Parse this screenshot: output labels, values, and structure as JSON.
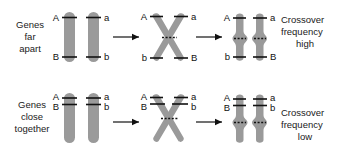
{
  "figure": {
    "background_color": "#ffffff",
    "chromosome_color": "#9a9a9a",
    "line_color": "#111111"
  },
  "rows": [
    {
      "id": "genes-far-apart",
      "row_label": "Genes\nfar\napart",
      "row_label_lines": [
        "Genes",
        "far",
        "apart"
      ],
      "result_label_lines": [
        "Crossover",
        "frequency",
        "high"
      ],
      "stages": [
        {
          "name": "homologous-pair",
          "chromosomes": [
            {
              "side": "left",
              "alleles": [
                {
                  "symbol": "A",
                  "position": "top"
                },
                {
                  "symbol": "B",
                  "position": "bottom"
                }
              ]
            },
            {
              "side": "right",
              "alleles": [
                {
                  "symbol": "a",
                  "position": "top"
                },
                {
                  "symbol": "b",
                  "position": "bottom"
                }
              ]
            }
          ]
        },
        {
          "name": "crossover-x",
          "chromosomes": [
            {
              "side": "left",
              "alleles": [
                {
                  "symbol": "A",
                  "position": "top-left"
                },
                {
                  "symbol": "b",
                  "position": "bottom-left"
                }
              ]
            },
            {
              "side": "right",
              "alleles": [
                {
                  "symbol": "a",
                  "position": "top-right"
                },
                {
                  "symbol": "B",
                  "position": "bottom-right"
                }
              ]
            }
          ]
        },
        {
          "name": "recombinant-pair",
          "chromosomes": [
            {
              "side": "left",
              "alleles": [
                {
                  "symbol": "A",
                  "position": "top"
                },
                {
                  "symbol": "b",
                  "position": "bottom"
                }
              ]
            },
            {
              "side": "right",
              "alleles": [
                {
                  "symbol": "a",
                  "position": "top"
                },
                {
                  "symbol": "B",
                  "position": "bottom"
                }
              ]
            }
          ]
        }
      ]
    },
    {
      "id": "genes-close-together",
      "row_label": "Genes\nclose\ntogether",
      "row_label_lines": [
        "Genes",
        "close",
        "together"
      ],
      "result_label_lines": [
        "Crossover",
        "frequency",
        "low"
      ],
      "stages": [
        {
          "name": "homologous-pair",
          "chromosomes": [
            {
              "side": "left",
              "alleles": [
                {
                  "symbol": "A",
                  "position": "top"
                },
                {
                  "symbol": "B",
                  "position": "top"
                }
              ]
            },
            {
              "side": "right",
              "alleles": [
                {
                  "symbol": "a",
                  "position": "top"
                },
                {
                  "symbol": "b",
                  "position": "top"
                }
              ]
            }
          ]
        },
        {
          "name": "crossover-x",
          "chromosomes": [
            {
              "side": "left",
              "alleles": [
                {
                  "symbol": "A",
                  "position": "top-left"
                },
                {
                  "symbol": "B",
                  "position": "top-left"
                }
              ]
            },
            {
              "side": "right",
              "alleles": [
                {
                  "symbol": "a",
                  "position": "top-right"
                },
                {
                  "symbol": "b",
                  "position": "top-right"
                }
              ]
            }
          ]
        },
        {
          "name": "parental-pair",
          "chromosomes": [
            {
              "side": "left",
              "alleles": [
                {
                  "symbol": "A",
                  "position": "top"
                },
                {
                  "symbol": "B",
                  "position": "top"
                }
              ]
            },
            {
              "side": "right",
              "alleles": [
                {
                  "symbol": "a",
                  "position": "top"
                },
                {
                  "symbol": "b",
                  "position": "top"
                }
              ]
            }
          ]
        }
      ]
    }
  ],
  "labels": {
    "row1_left_l1": "Genes",
    "row1_left_l2": "far",
    "row1_left_l3": "apart",
    "row2_left_l1": "Genes",
    "row2_left_l2": "close",
    "row2_left_l3": "together",
    "row1_right_l1": "Crossover",
    "row1_right_l2": "frequency",
    "row1_right_l3": "high",
    "row2_right_l1": "Crossover",
    "row2_right_l2": "frequency",
    "row2_right_l3": "low",
    "r1s1_A": "A",
    "r1s1_a": "a",
    "r1s1_B": "B",
    "r1s1_b": "b",
    "r1s2_A": "A",
    "r1s2_a": "a",
    "r1s2_b": "b",
    "r1s2_B": "B",
    "r1s3_A": "A",
    "r1s3_a": "a",
    "r1s3_b": "b",
    "r1s3_B": "B",
    "r2s1_A": "A",
    "r2s1_B": "B",
    "r2s1_a": "a",
    "r2s1_b": "b",
    "r2s2_A": "A",
    "r2s2_B": "B",
    "r2s2_a": "a",
    "r2s2_b": "b",
    "r2s3_A": "A",
    "r2s3_B": "B",
    "r2s3_a": "a",
    "r2s3_b": "b"
  }
}
